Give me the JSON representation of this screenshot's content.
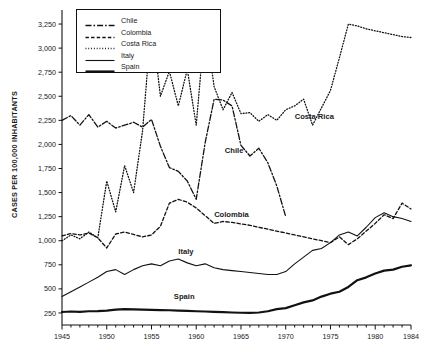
{
  "chart_data": {
    "type": "line",
    "title": "",
    "xlabel": "",
    "ylabel": "CASES PER 100,000 INHABITANTS",
    "xlim": [
      1945,
      1984
    ],
    "ylim": [
      125,
      3375
    ],
    "grid": false,
    "legend_position": "top-left-inside",
    "y_ticks": [
      250,
      500,
      750,
      1000,
      1250,
      1500,
      1750,
      2000,
      2250,
      2500,
      2750,
      3000,
      3250
    ],
    "y_tick_labels": [
      "250",
      "500",
      "750",
      "1,000",
      "1,250",
      "1,500",
      "1,750",
      "2,000",
      "2,250",
      "2,500",
      "2,750",
      "3,000",
      "3,250"
    ],
    "x_ticks": [
      1945,
      1950,
      1955,
      1960,
      1965,
      1970,
      1975,
      1980,
      1984
    ],
    "x_tick_labels": [
      "1945",
      "1950",
      "1955",
      "1960",
      "1965",
      "1970",
      "1975",
      "1980",
      "1984"
    ],
    "x_minor_step": 1,
    "series": [
      {
        "name": "Chile",
        "style": "dash-dot",
        "color": "#111111",
        "width": 1.3,
        "inline_label": "Chile",
        "inline_label_x": 1963.2,
        "inline_label_y": 1930,
        "x": [
          1945,
          1946,
          1947,
          1948,
          1949,
          1950,
          1951,
          1952,
          1953,
          1954,
          1955,
          1956,
          1957,
          1958,
          1959,
          1960,
          1961,
          1962,
          1963,
          1964,
          1965,
          1966,
          1967,
          1968,
          1969,
          1970
        ],
        "values": [
          2250,
          2300,
          2200,
          2310,
          2180,
          2240,
          2170,
          2200,
          2230,
          2180,
          2260,
          1980,
          1760,
          1720,
          1620,
          1430,
          2020,
          2470,
          2460,
          2400,
          1990,
          1880,
          1960,
          1810,
          1570,
          1250
        ]
      },
      {
        "name": "Colombia",
        "style": "dashed",
        "color": "#111111",
        "width": 1.3,
        "inline_label": "Colombia",
        "inline_label_x": 1962.0,
        "inline_label_y": 1265,
        "x": [
          1945,
          1946,
          1947,
          1948,
          1949,
          1950,
          1951,
          1952,
          1953,
          1954,
          1955,
          1956,
          1957,
          1958,
          1959,
          1960,
          1961,
          1962,
          1963,
          1964,
          1965,
          1966,
          1967,
          1968,
          1969,
          1970,
          1971,
          1972,
          1973,
          1974,
          1975,
          1976,
          1977,
          1978,
          1979,
          1980,
          1981,
          1982,
          1983,
          1984
        ],
        "values": [
          1050,
          1075,
          1060,
          1080,
          1030,
          925,
          1070,
          1090,
          1065,
          1040,
          1060,
          1150,
          1390,
          1430,
          1400,
          1340,
          1260,
          1180,
          1200,
          1190,
          1175,
          1160,
          1140,
          1120,
          1100,
          1080,
          1060,
          1040,
          1020,
          1000,
          980,
          1040,
          960,
          1020,
          1100,
          1180,
          1270,
          1230,
          1390,
          1330
        ]
      },
      {
        "name": "Costa Rica",
        "style": "dotted",
        "color": "#111111",
        "width": 1.3,
        "inline_label": "Costa Rica",
        "inline_label_x": 1971.0,
        "inline_label_y": 2280,
        "x": [
          1945,
          1946,
          1947,
          1948,
          1949,
          1950,
          1951,
          1952,
          1953,
          1954,
          1955,
          1956,
          1957,
          1958,
          1959,
          1960,
          1961,
          1962,
          1963,
          1964,
          1965,
          1966,
          1967,
          1968,
          1969,
          1970,
          1971,
          1972,
          1973,
          1974,
          1975,
          1976,
          1977,
          1978,
          1979,
          1980,
          1981,
          1982,
          1983,
          1984
        ],
        "values": [
          1000,
          1060,
          1020,
          1090,
          1030,
          1620,
          1300,
          1780,
          1500,
          2140,
          3290,
          2500,
          2760,
          2400,
          2780,
          2200,
          3280,
          2600,
          2360,
          2540,
          2320,
          2330,
          2240,
          2310,
          2250,
          2360,
          2400,
          2470,
          2200,
          2380,
          2560,
          2900,
          3250,
          3230,
          3200,
          3180,
          3160,
          3140,
          3120,
          3110
        ]
      },
      {
        "name": "Italy",
        "style": "solid-thin",
        "color": "#111111",
        "width": 1.1,
        "inline_label": "Italy",
        "inline_label_x": 1958.0,
        "inline_label_y": 880,
        "x": [
          1945,
          1946,
          1947,
          1948,
          1949,
          1950,
          1951,
          1952,
          1953,
          1954,
          1955,
          1956,
          1957,
          1958,
          1959,
          1960,
          1961,
          1962,
          1963,
          1964,
          1965,
          1966,
          1967,
          1968,
          1969,
          1970,
          1971,
          1972,
          1973,
          1974,
          1975,
          1976,
          1977,
          1978,
          1979,
          1980,
          1981,
          1982,
          1983,
          1984
        ],
        "values": [
          420,
          470,
          520,
          570,
          620,
          680,
          700,
          650,
          700,
          740,
          760,
          740,
          790,
          810,
          770,
          740,
          760,
          720,
          700,
          690,
          680,
          670,
          660,
          650,
          650,
          680,
          760,
          830,
          900,
          920,
          980,
          1060,
          1090,
          1050,
          1140,
          1240,
          1290,
          1250,
          1230,
          1200
        ]
      },
      {
        "name": "Spain",
        "style": "solid-thick",
        "color": "#111111",
        "width": 2.2,
        "inline_label": "Spain",
        "inline_label_x": 1957.5,
        "inline_label_y": 420,
        "x": [
          1945,
          1946,
          1947,
          1948,
          1949,
          1950,
          1951,
          1952,
          1953,
          1954,
          1955,
          1956,
          1957,
          1958,
          1959,
          1960,
          1961,
          1962,
          1963,
          1964,
          1965,
          1966,
          1967,
          1968,
          1969,
          1970,
          1971,
          1972,
          1973,
          1974,
          1975,
          1976,
          1977,
          1978,
          1979,
          1980,
          1981,
          1982,
          1983,
          1984
        ],
        "values": [
          260,
          265,
          262,
          268,
          270,
          275,
          285,
          290,
          288,
          285,
          282,
          280,
          278,
          275,
          272,
          268,
          265,
          262,
          258,
          255,
          252,
          250,
          255,
          268,
          290,
          300,
          330,
          360,
          380,
          420,
          450,
          470,
          520,
          590,
          620,
          660,
          690,
          700,
          730,
          745
        ]
      }
    ]
  },
  "legend": {
    "items": [
      {
        "label": "Chile",
        "style": "dash-dot"
      },
      {
        "label": "Colombia",
        "style": "dashed"
      },
      {
        "label": "Costa Rica",
        "style": "dotted"
      },
      {
        "label": "Italy",
        "style": "solid-thin"
      },
      {
        "label": "Spain",
        "style": "solid-thick"
      }
    ]
  }
}
